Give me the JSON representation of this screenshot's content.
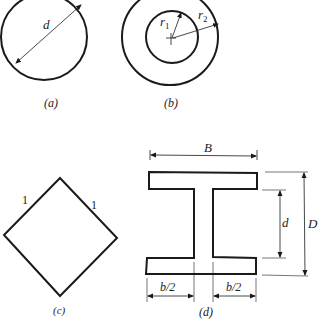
{
  "figure": {
    "panels": [
      {
        "id": "a",
        "caption": "(a)",
        "shape": "solid circle",
        "dimension_labels": [
          "d"
        ]
      },
      {
        "id": "b",
        "caption": "(b)",
        "shape": "hollow circle (annulus)",
        "dimension_labels": [
          "r1",
          "r2"
        ]
      },
      {
        "id": "c",
        "caption": "(c)",
        "shape": "square rotated 45°",
        "dimension_labels": [
          "1",
          "1"
        ]
      },
      {
        "id": "d",
        "caption": "(d)",
        "shape": "I-section",
        "dimension_labels": [
          "B",
          "D",
          "d",
          "b/2",
          "b/2"
        ]
      }
    ],
    "labels": {
      "a_d": "d",
      "a_caption": "(a)",
      "b_r": "r",
      "b_r1_sub": "1",
      "b_r2_sub": "2",
      "b_caption": "(b)",
      "c_side_left": "1",
      "c_side_right": "1",
      "c_caption": "(c)",
      "d_B": "B",
      "d_D": "D",
      "d_d": "d",
      "d_b2_left": "b/2",
      "d_b2_right": "b/2",
      "d_caption": "(d)"
    },
    "colors": {
      "stroke": "#1a1a1a",
      "background": "#ffffff"
    }
  }
}
